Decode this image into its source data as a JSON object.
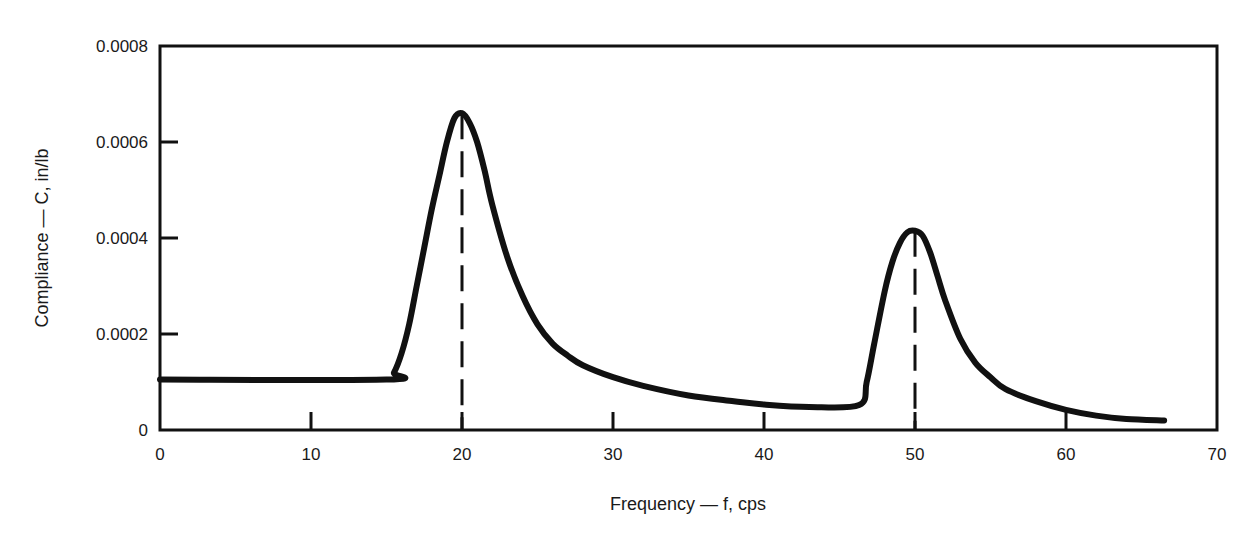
{
  "chart_data": {
    "type": "line",
    "title": "",
    "xlabel": "Frequency — f, cps",
    "ylabel": "Compliance — C, in/lb",
    "xlim": [
      0,
      70
    ],
    "ylim": [
      0,
      0.0008
    ],
    "grid": false,
    "legend": null,
    "x_ticks": [
      0,
      10,
      20,
      30,
      40,
      50,
      60,
      70
    ],
    "x_tick_labels": [
      "0",
      "10",
      "20",
      "30",
      "40",
      "50",
      "60",
      "70"
    ],
    "y_ticks": [
      0,
      0.0002,
      0.0004,
      0.0006,
      0.0008
    ],
    "y_tick_labels": [
      "0",
      "0.0002",
      "0.0004",
      "0.0006",
      "0.0008"
    ],
    "annotations": [
      {
        "type": "dashed-vertical-line",
        "x": 20,
        "label": "resonance peak 1"
      },
      {
        "type": "dashed-vertical-line",
        "x": 50,
        "label": "resonance peak 2"
      }
    ],
    "series": [
      {
        "name": "Compliance",
        "x": [
          0,
          15,
          15.5,
          16,
          16.5,
          17,
          17.5,
          18,
          18.5,
          19,
          19.5,
          20,
          20.5,
          21,
          21.5,
          22,
          23,
          24,
          25,
          26,
          27,
          28,
          30,
          32,
          35,
          38,
          40,
          43,
          46.3,
          46.8,
          47.3,
          48,
          48.5,
          49,
          49.5,
          50,
          50.5,
          51,
          51.5,
          52,
          53,
          54,
          55,
          56,
          58,
          60,
          62,
          64,
          66.5
        ],
        "values": [
          0.000105,
          0.000105,
          0.00012,
          0.00016,
          0.00022,
          0.0003,
          0.00038,
          0.00046,
          0.00053,
          0.0006,
          0.00065,
          0.00066,
          0.00064,
          0.0006,
          0.00054,
          0.00047,
          0.00036,
          0.00028,
          0.00022,
          0.00018,
          0.000155,
          0.000135,
          0.00011,
          9.2e-05,
          7.2e-05,
          6e-05,
          5.3e-05,
          4.8e-05,
          5.2e-05,
          0.0001,
          0.00018,
          0.00029,
          0.00035,
          0.00039,
          0.000412,
          0.000415,
          0.000405,
          0.00037,
          0.00032,
          0.00027,
          0.00019,
          0.00014,
          0.00011,
          8.5e-05,
          6e-05,
          4.2e-05,
          3e-05,
          2.3e-05,
          2e-05
        ]
      }
    ]
  },
  "colors": {
    "line": "#111111",
    "axis": "#111111",
    "background": "#ffffff"
  }
}
